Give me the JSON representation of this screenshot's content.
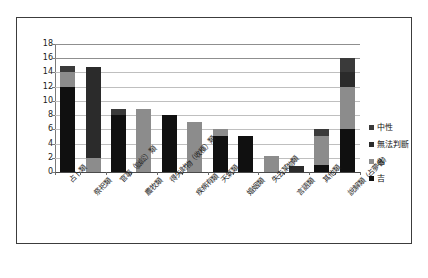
{
  "chart_data": {
    "type": "bar",
    "stacked": true,
    "title": "",
    "xlabel": "",
    "ylabel": "",
    "ylim": [
      0,
      18
    ],
    "ytick_labels": [
      "0",
      "2",
      "4",
      "6",
      "8",
      "10",
      "12",
      "14",
      "16",
      "18"
    ],
    "ytick_values": [
      0,
      2,
      4,
      6,
      8,
      10,
      12,
      14,
      16,
      18
    ],
    "grid": true,
    "legend_position": "right",
    "categories": [
      "占卜類",
      "祭祀類",
      "官事（獄訟）類",
      "農牧類",
      "得失財物（收穫）類",
      "疾病有類",
      "天氣類",
      "婚姻類",
      "失去某物類",
      "言語類",
      "其他類",
      "說解類（占夢書）"
    ],
    "categories_plotted": [
      "占卜類",
      "祭祀類",
      "官事（獄訟）類",
      "農牧類",
      "得失財物（收穫）類",
      "疾病有類",
      "天氣類",
      "婚姻類",
      "失去某物類",
      "言語類",
      "其他類",
      "說解類（占夢書）"
    ],
    "series": [
      {
        "name": "吉",
        "color": "#101010",
        "values": [
          12,
          0,
          8,
          0,
          8,
          0,
          5,
          5,
          0,
          0,
          1,
          6
        ]
      },
      {
        "name": "凶",
        "color": "#8c8c8c",
        "values": [
          2,
          2,
          0,
          8.8,
          0,
          7,
          1,
          0,
          2.2,
          0,
          4,
          6
        ]
      },
      {
        "name": "無法判斷",
        "color": "#2b2b2b",
        "values": [
          0,
          12.8,
          0,
          0,
          0,
          0,
          0,
          0,
          0,
          0.8,
          0,
          2
        ]
      },
      {
        "name": "中性",
        "color": "#3a3a3a",
        "values": [
          0.9,
          0,
          0.8,
          0,
          0,
          0,
          0,
          0,
          0,
          0,
          1,
          2
        ]
      }
    ],
    "bar_totals": [
      14.9,
      14.8,
      8.8,
      8.8,
      8,
      7,
      6,
      5,
      2.2,
      0.8,
      6,
      16
    ]
  },
  "legend": {
    "items": [
      {
        "label": "中性",
        "color": "#3a3a3a"
      },
      {
        "label": "無法判斷",
        "color": "#2b2b2b"
      },
      {
        "label": "凶",
        "color": "#8c8c8c"
      },
      {
        "label": "吉",
        "color": "#101010"
      }
    ]
  }
}
